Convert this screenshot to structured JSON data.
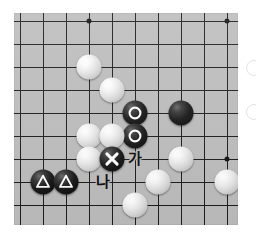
{
  "diagram": {
    "type": "go-board-diagram",
    "title": "",
    "board": {
      "background_color": "#bdbdbd",
      "line_color": "#1c1c1c",
      "cols": 10,
      "rows": 10,
      "cell_size": 23,
      "origin_x": 6,
      "origin_y": 8,
      "star_points": [
        {
          "col": 3,
          "row": 0
        },
        {
          "col": 9,
          "row": 0
        },
        {
          "col": 9,
          "row": 6
        }
      ]
    },
    "stones": [
      {
        "id": "w1",
        "color": "white",
        "col": 3,
        "row": 2,
        "marker": "none"
      },
      {
        "id": "w2",
        "color": "white",
        "col": 4,
        "row": 3,
        "marker": "none"
      },
      {
        "id": "b1",
        "color": "black",
        "col": 5,
        "row": 4,
        "marker": "circle"
      },
      {
        "id": "b2",
        "color": "black",
        "col": 5,
        "row": 5,
        "marker": "circle"
      },
      {
        "id": "b3",
        "color": "black",
        "col": 7,
        "row": 4,
        "marker": "none"
      },
      {
        "id": "w3",
        "color": "white",
        "col": 3,
        "row": 5,
        "marker": "none"
      },
      {
        "id": "w4",
        "color": "white",
        "col": 4,
        "row": 5,
        "marker": "none"
      },
      {
        "id": "w5",
        "color": "white",
        "col": 3,
        "row": 6,
        "marker": "none"
      },
      {
        "id": "b4",
        "color": "black",
        "col": 4,
        "row": 6,
        "marker": "cross"
      },
      {
        "id": "w6",
        "color": "white",
        "col": 7,
        "row": 6,
        "marker": "none"
      },
      {
        "id": "b5",
        "color": "black",
        "col": 1,
        "row": 7,
        "marker": "triangle"
      },
      {
        "id": "b6",
        "color": "black",
        "col": 2,
        "row": 7,
        "marker": "triangle"
      },
      {
        "id": "w7",
        "color": "white",
        "col": 6,
        "row": 7,
        "marker": "none"
      },
      {
        "id": "w8",
        "color": "white",
        "col": 9,
        "row": 7,
        "marker": "none"
      },
      {
        "id": "w9",
        "color": "white",
        "col": 5,
        "row": 8,
        "marker": "none"
      }
    ],
    "labels": [
      {
        "id": "ga",
        "text": "가",
        "col": 5,
        "row": 6
      },
      {
        "id": "na",
        "text": "나",
        "col": 3.6,
        "row": 7
      }
    ],
    "marker_colors": {
      "circle": "#ffffff",
      "cross": "#ffffff",
      "triangle": "#ffffff"
    },
    "label_color": "#0d0d0d"
  }
}
